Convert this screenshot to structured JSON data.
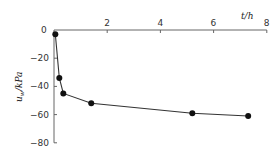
{
  "chart_data": {
    "type": "line",
    "title": "",
    "xlabel": "t/h",
    "ylabel": "u_w/kPa",
    "xlim": [
      0,
      8
    ],
    "ylim": [
      -80,
      0
    ],
    "x_ticks": [
      "0",
      "2",
      "4",
      "6",
      "8"
    ],
    "y_ticks": [
      "-20",
      "-40",
      "-60",
      "-80"
    ],
    "x_axis_position": "top",
    "grid": false,
    "legend": null,
    "series": [
      {
        "name": "u_w",
        "x": [
          0.05,
          0.2,
          0.35,
          1.4,
          5.2,
          7.3
        ],
        "values": [
          -3,
          -34,
          -45,
          -52,
          -59,
          -61
        ],
        "marker": "filled-circle",
        "color": "#111111"
      }
    ]
  },
  "labels": {
    "origin": "0",
    "x_axis_title": "t/h",
    "y_axis_title_main": "u",
    "y_axis_title_sub": "w",
    "y_axis_title_unit": "/kPa"
  }
}
